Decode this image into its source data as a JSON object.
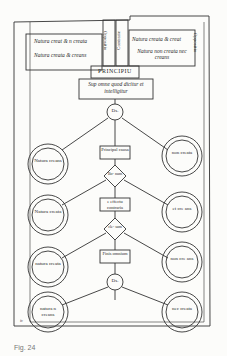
{
  "diagram": {
    "type": "medieval manuscript classification diagram (Division of Nature)",
    "top_left_box": {
      "line1": "Natura creat & n creata",
      "line2": "Natura creata & creans"
    },
    "top_right_box": {
      "line1": "Natura creata & creat",
      "line2": "Natura non creata nec creans"
    },
    "vertical_labels": [
      "Oppositio",
      "Contrarie",
      "Oppositio"
    ],
    "principium_label": "PRINCIPIU",
    "super_box": "Sup omne quod dicitur et intelligitur",
    "nodes": {
      "top_small_circle": "Ds.",
      "center_box_1": "Principal causa",
      "diamond_1": "Bo- num",
      "center_box_2": "e effectu contraria",
      "diamond_2": "cle- sum",
      "center_box_3": "Finis omnium",
      "bottom_small_circle": "Ds."
    },
    "circles": [
      {
        "side": "left",
        "label": "Natura creans"
      },
      {
        "side": "right",
        "label": "non creata"
      },
      {
        "side": "left",
        "label": "Natura creata"
      },
      {
        "side": "right",
        "label": "et cre ans"
      },
      {
        "side": "left",
        "label": "natura creata"
      },
      {
        "side": "right",
        "label": "non cre ans"
      },
      {
        "side": "left",
        "label": "natura n creans"
      },
      {
        "side": "right",
        "label": "nec creata"
      }
    ],
    "corner_mark": "iv",
    "caption": "Fig. 24"
  }
}
